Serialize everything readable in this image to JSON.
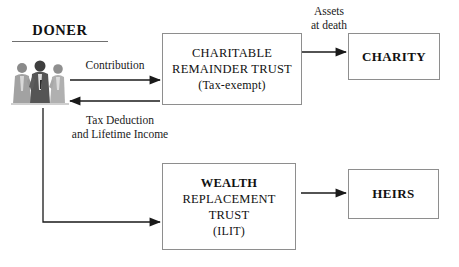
{
  "diagram": {
    "title_text": "DONER",
    "donor": {
      "label": "DONER",
      "figure_alt": "three-business-people"
    },
    "nodes": [
      {
        "id": "charitable-remainder-trust",
        "lines": [
          "CHARITABLE",
          "REMAINDER TRUST",
          "(Tax-exempt)"
        ]
      },
      {
        "id": "charity",
        "lines": [
          "CHARITY"
        ]
      },
      {
        "id": "wealth-replacement-trust",
        "lines": [
          "WEALTH",
          "REPLACEMENT",
          "TRUST",
          "(ILIT)"
        ]
      },
      {
        "id": "heirs",
        "lines": [
          "HEIRS"
        ]
      }
    ],
    "edges": [
      {
        "id": "contribution",
        "label_lines": [
          "Contribution"
        ],
        "from": "donor",
        "to": "charitable-remainder-trust"
      },
      {
        "id": "tax-deduction",
        "label_lines": [
          "Tax Deduction",
          "and Lifetime Income"
        ],
        "from": "charitable-remainder-trust",
        "to": "donor"
      },
      {
        "id": "assets-at-death",
        "label_lines": [
          "Assets",
          "at death"
        ],
        "from": "charitable-remainder-trust",
        "to": "charity"
      },
      {
        "id": "donor-to-wealth-trust",
        "label_lines": [],
        "from": "donor",
        "to": "wealth-replacement-trust"
      },
      {
        "id": "wealth-trust-to-heirs",
        "label_lines": [],
        "from": "wealth-replacement-trust",
        "to": "heirs"
      }
    ],
    "colors": {
      "background": "#ffffff",
      "box_border": "#8e8e8e",
      "line": "#1a1a1a",
      "text": "#111111"
    }
  }
}
